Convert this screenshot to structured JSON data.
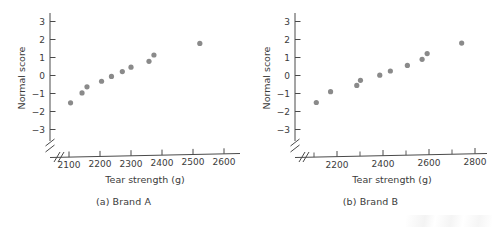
{
  "figure": {
    "background": "#ffffff",
    "marker_color": "#8a8a8a",
    "axis_color": "#4a4a4a",
    "text_color": "#3b3b3b"
  },
  "panels": [
    {
      "id": "a",
      "caption": "(a) Brand A",
      "chart_data": {
        "type": "scatter",
        "title": "(a) Brand A",
        "xlabel": "Tear strength (g)",
        "ylabel": "Normal score",
        "xlim": [
          2050,
          2650
        ],
        "ylim": [
          -3.5,
          3.5
        ],
        "xticks": [
          2100,
          2200,
          2300,
          2400,
          2500,
          2600
        ],
        "xticklabels": [
          "2100",
          "2200",
          "2300",
          "2400",
          "2500",
          "2600"
        ],
        "yticks": [
          3,
          2,
          1,
          0,
          -1,
          -2,
          -3
        ],
        "yticklabels": [
          "3",
          "2",
          "1",
          "0",
          "−1",
          "−2",
          "−3"
        ],
        "axis_break_x": true,
        "axis_break_y": true,
        "grid": false,
        "legend": "none",
        "x": [
          2105,
          2142,
          2158,
          2205,
          2237,
          2270,
          2287,
          2302,
          2358,
          2372,
          2520
        ],
        "y": [
          -1.52,
          -0.97,
          -0.63,
          -0.32,
          -0.05,
          0.2,
          0.45,
          0.45,
          0.79,
          1.14,
          1.78
        ],
        "points": [
          {
            "x": 2105,
            "y": -1.52
          },
          {
            "x": 2142,
            "y": -0.97
          },
          {
            "x": 2158,
            "y": -0.63
          },
          {
            "x": 2205,
            "y": -0.32
          },
          {
            "x": 2237,
            "y": -0.05
          },
          {
            "x": 2272,
            "y": 0.22
          },
          {
            "x": 2300,
            "y": 0.46
          },
          {
            "x": 2358,
            "y": 0.79
          },
          {
            "x": 2374,
            "y": 1.14
          },
          {
            "x": 2522,
            "y": 1.78
          }
        ]
      }
    },
    {
      "id": "b",
      "caption": "(b) Brand B",
      "chart_data": {
        "type": "scatter",
        "title": "(b) Brand B",
        "xlabel": "Tear strength (g)",
        "ylabel": "Normal score",
        "xlim": [
          2050,
          2900
        ],
        "ylim": [
          -3.5,
          3.5
        ],
        "xticks": [
          2200,
          2400,
          2600,
          2800
        ],
        "xticklabels": [
          "2200",
          "2400",
          "2600",
          "2800"
        ],
        "xticks_minor": [
          2100,
          2300,
          2500,
          2700
        ],
        "yticks": [
          3,
          2,
          1,
          0,
          -1,
          -2,
          -3
        ],
        "yticklabels": [
          "3",
          "2",
          "1",
          "0",
          "−1",
          "−2",
          "−3"
        ],
        "axis_break_x": true,
        "axis_break_y": true,
        "grid": false,
        "legend": "none",
        "x": [
          2110,
          2170,
          2285,
          2300,
          2385,
          2430,
          2505,
          2570,
          2590,
          2740
        ],
        "y": [
          -1.5,
          -0.9,
          -0.55,
          -0.27,
          0.02,
          0.25,
          0.56,
          0.9,
          1.22,
          1.8
        ],
        "points": [
          {
            "x": 2110,
            "y": -1.5
          },
          {
            "x": 2172,
            "y": -0.9
          },
          {
            "x": 2286,
            "y": -0.55
          },
          {
            "x": 2302,
            "y": -0.27
          },
          {
            "x": 2386,
            "y": 0.02
          },
          {
            "x": 2432,
            "y": 0.25
          },
          {
            "x": 2506,
            "y": 0.56
          },
          {
            "x": 2570,
            "y": 0.9
          },
          {
            "x": 2592,
            "y": 1.22
          },
          {
            "x": 2742,
            "y": 1.8
          }
        ]
      }
    }
  ]
}
